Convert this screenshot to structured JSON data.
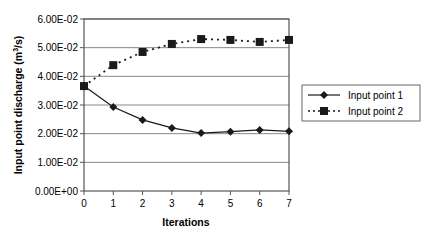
{
  "chart_data": {
    "type": "line",
    "title": "",
    "xlabel": "Iterations",
    "ylabel": "Input point discharge (m³/s)",
    "ylabel_parts": {
      "pre": "Input point discharge (m",
      "sup": "3",
      "post": "/s)"
    },
    "x": [
      0,
      1,
      2,
      3,
      4,
      5,
      6,
      7
    ],
    "x_tick_labels": [
      "0",
      "1",
      "2",
      "3",
      "4",
      "5",
      "6",
      "7"
    ],
    "y_tick_values": [
      0,
      0.01,
      0.02,
      0.03,
      0.04,
      0.05,
      0.06
    ],
    "y_tick_labels": [
      "0.00E+00",
      "1.00E-02",
      "2.00E-02",
      "3.00E-02",
      "4.00E-02",
      "5.00E-02",
      "6.00E-02"
    ],
    "ylim": [
      0,
      0.06
    ],
    "xlim": [
      0,
      7
    ],
    "grid": {
      "horizontal": true,
      "vertical": false
    },
    "legend_position": "right",
    "series": [
      {
        "name": "Input point 1",
        "marker": "diamond",
        "line_style": "solid",
        "color": "#1a1a1a",
        "values": [
          0.0366,
          0.0293,
          0.0248,
          0.022,
          0.0202,
          0.0207,
          0.0213,
          0.0208
        ]
      },
      {
        "name": "Input point 2",
        "marker": "square",
        "line_style": "dotted",
        "color": "#1a1a1a",
        "values": [
          0.0366,
          0.0439,
          0.0485,
          0.0513,
          0.053,
          0.0527,
          0.052,
          0.0527
        ]
      }
    ]
  },
  "colors": {
    "axis": "#555555",
    "grid": "#888888",
    "series": "#1a1a1a",
    "background": "#ffffff"
  }
}
